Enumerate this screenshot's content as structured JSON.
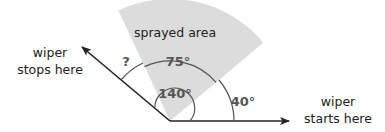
{
  "diagram": {
    "sector_label": "sprayed area",
    "angles": {
      "sprayed": "75°",
      "total_sweep": "140°",
      "unknown": "?",
      "start_offset": "40°"
    },
    "labels": {
      "stop_line1": "wiper",
      "stop_line2": "stops here",
      "start_line1": "wiper",
      "start_line2": "starts here"
    },
    "colors": {
      "sector_fill": "#dcdcdc",
      "line": "#222222",
      "arc": "#555555"
    }
  }
}
